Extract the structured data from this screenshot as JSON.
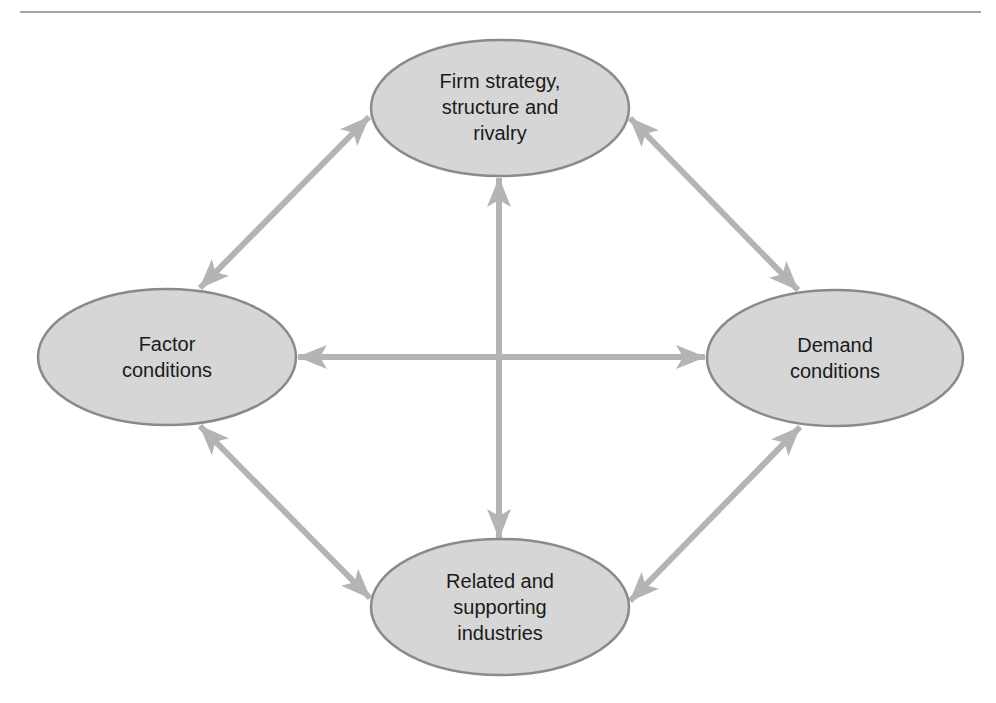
{
  "diagram": {
    "colors": {
      "node_fill": "#d6d6d6",
      "node_border": "#8a8a8a",
      "arrow": "#b4b4b4",
      "rule": "#a6a6a6",
      "text": "#1a1a1a"
    },
    "nodes": {
      "top": {
        "label": "Firm strategy,\nstructure and\nrivalry"
      },
      "left": {
        "label": "Factor\nconditions"
      },
      "right": {
        "label": "Demand\nconditions"
      },
      "bottom": {
        "label": "Related and\nsupporting\nindustries"
      }
    },
    "edges": [
      {
        "from": "left",
        "to": "top",
        "type": "bidirectional"
      },
      {
        "from": "top",
        "to": "right",
        "type": "bidirectional"
      },
      {
        "from": "left",
        "to": "bottom",
        "type": "bidirectional"
      },
      {
        "from": "right",
        "to": "bottom",
        "type": "bidirectional"
      },
      {
        "from": "left",
        "to": "right",
        "type": "bidirectional"
      },
      {
        "from": "top",
        "to": "bottom",
        "type": "bidirectional"
      }
    ]
  }
}
